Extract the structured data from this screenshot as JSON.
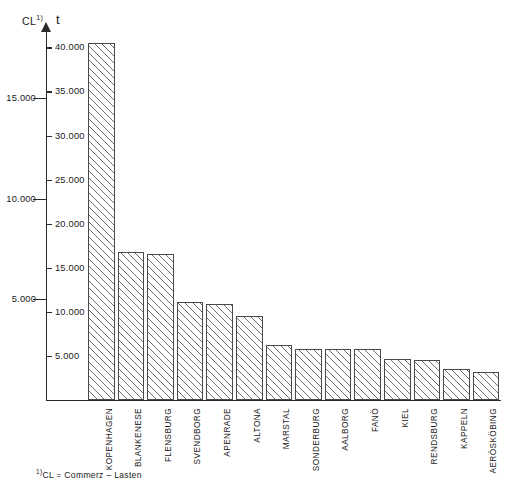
{
  "chart_data": {
    "type": "bar",
    "title": "",
    "xlabel": "",
    "ylabel": "t",
    "ylabel_secondary": "CL",
    "ylabel_secondary_note": "1)",
    "grid": false,
    "legend": "none",
    "orientation": "vertical",
    "bar_fill": "diagonal-hatch",
    "categories": [
      "KOPENHAGEN",
      "BLANKENESE",
      "FLENSBURG",
      "SVENDBORG",
      "APENRADE",
      "ALTONA",
      "MARSTAL",
      "SONDERBURG",
      "AALBORG",
      "FANÖ",
      "KIEL",
      "RENDSBURG",
      "KAPPELN",
      "AERÖSKÖBING"
    ],
    "values": [
      40500,
      16800,
      16600,
      11100,
      10900,
      9500,
      6200,
      5800,
      5800,
      5800,
      4700,
      4500,
      3500,
      3200
    ],
    "ylim": [
      0,
      42000
    ],
    "y_axis_right": {
      "unit": "t",
      "ticks": [
        5000,
        10000,
        15000,
        20000,
        25000,
        30000,
        35000,
        40000
      ],
      "tick_labels": [
        "5.000",
        "10.000",
        "15.000",
        "20.000",
        "25.000",
        "30.000",
        "35.000",
        "40.000"
      ]
    },
    "y_axis_left": {
      "unit": "CL",
      "ticks": [
        5000,
        10000,
        15000
      ],
      "tick_labels": [
        "5.000",
        "10.000",
        "15.000"
      ],
      "scale_factor_vs_t": 0.4375
    }
  },
  "footnote": {
    "marker": "1)",
    "text": "CL  =  Commerz – Lasten"
  }
}
